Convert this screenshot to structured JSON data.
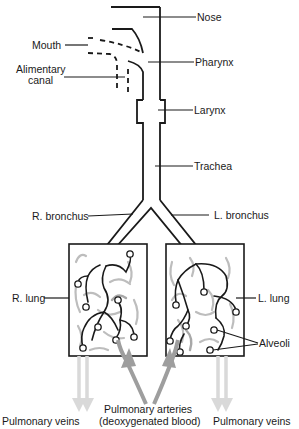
{
  "diagram": {
    "labels": {
      "nose": "Nose",
      "mouth": "Mouth",
      "pharynx": "Pharynx",
      "alimentary_line1": "Alimentary",
      "alimentary_line2": "canal",
      "larynx": "Larynx",
      "trachea": "Trachea",
      "r_bronchus": "R. bronchus",
      "l_bronchus": "L. bronchus",
      "r_lung": "R. lung",
      "l_lung": "L. lung",
      "alveoli": "Alveoli",
      "pulmonary_veins_left": "Pulmonary veins",
      "pulmonary_veins_right": "Pulmonary veins",
      "pulmonary_arteries_line1": "Pulmonary arteries",
      "pulmonary_arteries_line2": "(deoxygenated blood)"
    },
    "colors": {
      "line": "#1a1a1a",
      "capillary": "#bdbdbd",
      "artery_arrow": "#9e9e9e",
      "vein_arrow": "#d9d9d9"
    }
  }
}
